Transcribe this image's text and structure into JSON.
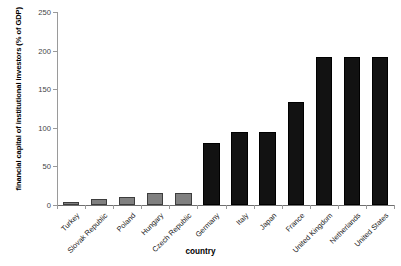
{
  "chart_data": {
    "type": "bar",
    "title": "",
    "xlabel": "country",
    "ylabel": "financial capital of institutional investors (% of GDP)",
    "categories": [
      "Turkey",
      "Slovak Republic",
      "Poland",
      "Hungary",
      "Czech Republic",
      "Germany",
      "Italy",
      "Japan",
      "France",
      "United Kingdom",
      "Netherlands",
      "United States"
    ],
    "values": [
      4,
      8,
      11,
      15,
      15,
      80,
      95,
      95,
      133,
      192,
      192,
      192
    ],
    "series": [
      {
        "name": "financial capital of institutional investors",
        "values": [
          4,
          8,
          11,
          15,
          15,
          80,
          95,
          95,
          133,
          192,
          192,
          192
        ]
      }
    ],
    "bar_colors": [
      "#808080",
      "#808080",
      "#808080",
      "#808080",
      "#808080",
      "#121212",
      "#121212",
      "#121212",
      "#121212",
      "#121212",
      "#121212",
      "#121212"
    ],
    "ylim": [
      0,
      250
    ],
    "yticks": [
      0,
      50,
      100,
      150,
      200,
      250
    ],
    "ytick_labels": [
      "0",
      "50",
      "100",
      "150",
      "200",
      "250"
    ],
    "grid": false,
    "legend": null
  },
  "axes": {
    "y_title": "financial capital of institutional investors (% of GDP)",
    "x_title": "country"
  },
  "colors": {
    "light_bar": "#808080",
    "dark_bar": "#121212",
    "axis": "#9a9a9a",
    "text": "#000000",
    "background": "#ffffff"
  }
}
